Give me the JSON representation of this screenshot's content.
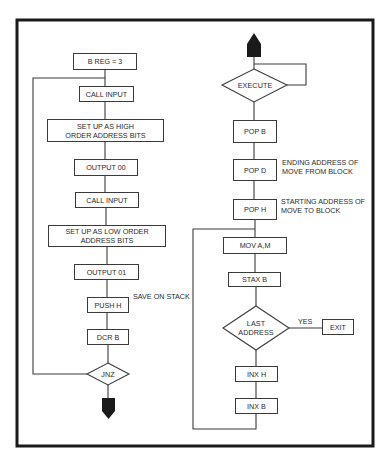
{
  "left_flow": {
    "steps": [
      {
        "label": "B REG = 3"
      },
      {
        "label": "CALL INPUT"
      },
      {
        "label_line1": "SET UP AS HIGH",
        "label_line2": "ORDER ADDRESS BITS"
      },
      {
        "label": "OUTPUT 00"
      },
      {
        "label": "CALL INPUT"
      },
      {
        "label_line1": "SET UP AS LOW ORDER",
        "label_line2": "ADDRESS BITS"
      },
      {
        "label": "OUTPUT 01"
      },
      {
        "label": "PUSH H",
        "note": "SAVE ON STACK"
      },
      {
        "label": "DCR B"
      }
    ],
    "decision": {
      "label": "JNZ"
    }
  },
  "right_flow": {
    "decision_top": {
      "label": "EXECUTE"
    },
    "steps": [
      {
        "label": "POP B"
      },
      {
        "label": "POP D",
        "note_line1": "ENDING ADDRESS OF",
        "note_line2": "MOVE FROM BLOCK"
      },
      {
        "label": "POP H",
        "note_line1": "STARTING ADDRESS OF",
        "note_line2": "MOVE TO BLOCK"
      },
      {
        "label": "MOV A,M"
      },
      {
        "label": "STAX B"
      }
    ],
    "decision_last": {
      "label_line1": "LAST",
      "label_line2": "ADDRESS",
      "yes_label": "YES"
    },
    "exit": {
      "label": "EXIT"
    },
    "increments": [
      {
        "label": "INX H"
      },
      {
        "label": "INX B"
      }
    ]
  },
  "colors": {
    "line": "#3a3a3a",
    "frame": "#1a1a1a",
    "arrow": "#1a1a1a",
    "text": "#2a2a2a"
  }
}
